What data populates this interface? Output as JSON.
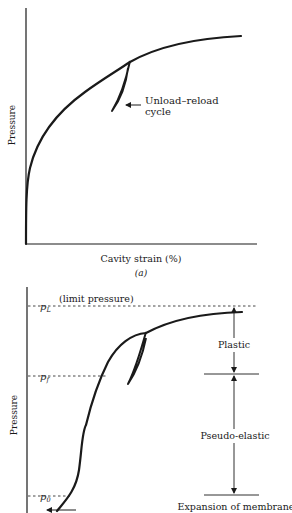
{
  "figure_a": {
    "ylabel": "Pressure",
    "xlabel": "Cavity strain (%)",
    "panel_label": "(a)",
    "annotation": {
      "line1": "Unload–reload",
      "line2": "cycle"
    }
  },
  "figure_b": {
    "ylabel": "Pressure",
    "limit_pressure_note": "(limit pressure)",
    "levels": {
      "pL": {
        "symbol": "p",
        "sub": "L"
      },
      "pf": {
        "symbol": "p",
        "sub": "f"
      },
      "p0": {
        "symbol": "p",
        "sub": "0"
      }
    },
    "zones": {
      "plastic": "Plastic",
      "pseudo_elastic": "Pseudo-elastic"
    },
    "bottom_note": "Expansion of membrane"
  },
  "colors": {
    "ink": "#1a1a1a",
    "background": "#ffffff"
  }
}
